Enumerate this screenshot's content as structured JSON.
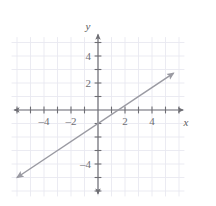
{
  "figure": {
    "kind": "coordinate-plane-line-graph",
    "background_color": "#ffffff",
    "grid_color": "#e9e9f0",
    "axis_color": "#6e6e74",
    "line_color": "#9a9aa2",
    "label_color": "#6e6e74"
  },
  "axes": {
    "x_label": "x",
    "y_label": "y",
    "x_min": -6.2,
    "x_max": 6.3,
    "y_min": -6.2,
    "y_max": 5.6,
    "grid": true,
    "grid_step": 1,
    "tick_step": 1
  },
  "x_ticks": [
    {
      "value": -4,
      "label": "–4"
    },
    {
      "value": -2,
      "label": "–2"
    },
    {
      "value": 2,
      "label": "2"
    },
    {
      "value": 4,
      "label": "4"
    }
  ],
  "y_ticks": [
    {
      "value": 4,
      "label": "4"
    },
    {
      "value": 2,
      "label": "2"
    },
    {
      "value": -4,
      "label": "–4"
    }
  ],
  "chart_data": {
    "type": "line",
    "title": "",
    "xlabel": "x",
    "ylabel": "y",
    "xlim": [
      -6.2,
      6.3
    ],
    "ylim": [
      -6.2,
      5.6
    ],
    "grid": true,
    "legend": "none",
    "series": [
      {
        "name": "line",
        "equation": "y = (2/3)x - 1",
        "slope": 0.6667,
        "intercept": -1,
        "x_intercept": 1.5,
        "y_intercept": -1,
        "arrow_start": true,
        "arrow_end": true,
        "x": [
          -6.0,
          5.6
        ],
        "values": [
          -5.0,
          2.73
        ],
        "points": [
          {
            "x": -6.0,
            "y": -5.0
          },
          {
            "x": -3.0,
            "y": -3.0
          },
          {
            "x": 0.0,
            "y": -1.0
          },
          {
            "x": 1.5,
            "y": 0.0
          },
          {
            "x": 3.0,
            "y": 1.0
          },
          {
            "x": 5.6,
            "y": 2.73
          }
        ]
      }
    ]
  }
}
